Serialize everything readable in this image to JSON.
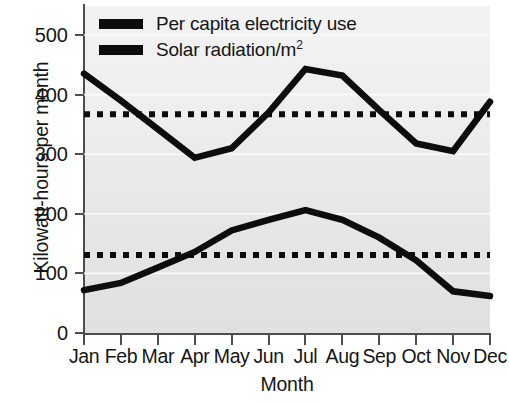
{
  "chart_data": {
    "type": "line",
    "title": "",
    "xlabel": "Month",
    "ylabel": "Kilowatt-hours per month",
    "categories": [
      "Jan",
      "Feb",
      "Mar",
      "Apr",
      "May",
      "Jun",
      "Jul",
      "Aug",
      "Sep",
      "Oct",
      "Nov",
      "Dec"
    ],
    "yticks": [
      0,
      100,
      200,
      300,
      400,
      500
    ],
    "ylim": [
      0,
      540
    ],
    "grid": true,
    "legend_position": "top-left",
    "series": [
      {
        "name": "Solar radiation/m2",
        "style": "solid",
        "color": "#0d0d0d",
        "values": [
          435,
          390,
          342,
          294,
          310,
          370,
          443,
          432,
          374,
          318,
          305,
          388
        ]
      },
      {
        "name": "Per capita electricity use",
        "style": "solid",
        "color": "#0d0d0d",
        "values": [
          72,
          84,
          110,
          136,
          172,
          190,
          206,
          190,
          160,
          122,
          70,
          62
        ]
      },
      {
        "name": "Solar radiation average",
        "style": "dotted",
        "color": "#0d0d0d",
        "values": [
          367,
          367,
          367,
          367,
          367,
          367,
          367,
          367,
          367,
          367,
          367,
          367
        ]
      },
      {
        "name": "Electricity use average",
        "style": "dotted",
        "color": "#0d0d0d",
        "values": [
          131,
          131,
          131,
          131,
          131,
          131,
          131,
          131,
          131,
          131,
          131,
          131
        ]
      }
    ]
  },
  "legend": {
    "items": [
      {
        "label": "Per capita electricity use"
      },
      {
        "label": "Solar radiation/m",
        "sup": "2"
      }
    ]
  },
  "axes": {
    "ylabel": "Kilowatt-hours per month",
    "xlabel": "Month",
    "ytick_labels": [
      "0",
      "100",
      "200",
      "300",
      "400",
      "500"
    ],
    "xtick_labels": [
      "Jan",
      "Feb",
      "Mar",
      "Apr",
      "May",
      "Jun",
      "Jul",
      "Aug",
      "Sep",
      "Oct",
      "Nov",
      "Dec"
    ]
  },
  "colors": {
    "line": "#0d0d0d",
    "axis": "#4d4d4d",
    "plot_background": "#e9e9e9",
    "gridline": "#fbfbfb",
    "text": "#161616"
  }
}
